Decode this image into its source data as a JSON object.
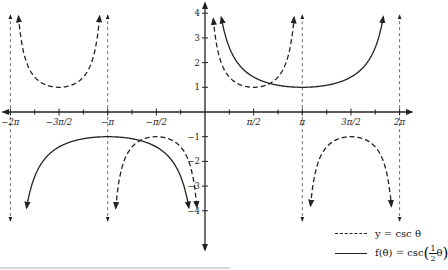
{
  "chart_data": {
    "type": "line",
    "title": "",
    "xlabel": "θ",
    "ylabel": "",
    "xlim": [
      -6.2832,
      6.2832
    ],
    "ylim": [
      -4,
      4
    ],
    "grid": false,
    "x_ticks": [
      {
        "value": -6.2832,
        "label": "−2π"
      },
      {
        "value": -4.7124,
        "label": "−3π/2"
      },
      {
        "value": -3.1416,
        "label": "−π"
      },
      {
        "value": -1.5708,
        "label": "−π/2"
      },
      {
        "value": 1.5708,
        "label": "π/2"
      },
      {
        "value": 3.1416,
        "label": "π"
      },
      {
        "value": 4.7124,
        "label": "3π/2"
      },
      {
        "value": 6.2832,
        "label": "2π"
      }
    ],
    "y_ticks": [
      {
        "value": 4,
        "label": "4"
      },
      {
        "value": 3,
        "label": "3"
      },
      {
        "value": 2,
        "label": "2"
      },
      {
        "value": 1,
        "label": "1"
      },
      {
        "value": -1,
        "label": "−1"
      },
      {
        "value": -2,
        "label": "−2"
      },
      {
        "value": -3,
        "label": "−3"
      },
      {
        "value": -4,
        "label": "−4"
      }
    ],
    "asymptotes_dashed": [
      -6.2832,
      -3.1416,
      3.1416,
      6.2832
    ],
    "series": [
      {
        "name": "y = csc θ",
        "style": "dashed",
        "function": "csc(x)",
        "key_points": [
          {
            "x": -4.7124,
            "y": 1
          },
          {
            "x": -1.5708,
            "y": -1
          },
          {
            "x": 1.5708,
            "y": 1
          },
          {
            "x": 4.7124,
            "y": -1
          }
        ]
      },
      {
        "name": "f(θ) = csc(½θ)",
        "style": "solid",
        "function": "csc(x/2)",
        "key_points": [
          {
            "x": -3.1416,
            "y": -1
          },
          {
            "x": 3.1416,
            "y": 1
          }
        ]
      }
    ],
    "legend": {
      "position": "bottom-right",
      "entries": [
        {
          "label": "y = csc θ",
          "style": "dashed"
        },
        {
          "label": "f(θ) = csc(½θ)",
          "style": "solid"
        }
      ]
    }
  },
  "legend": {
    "csc_label": "y = csc θ",
    "f_label_prefix": "f(θ) = csc",
    "f_label_num": "1",
    "f_label_den": "2",
    "f_label_var": "θ"
  },
  "colors": {
    "ink": "#222222",
    "background": "#ffffff"
  }
}
